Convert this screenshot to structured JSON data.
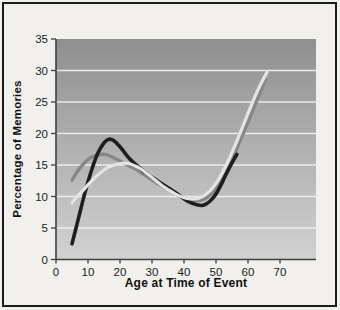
{
  "figure": {
    "background": "#f1f0ed",
    "border_color": "#1c1c1c"
  },
  "chart_data": {
    "type": "line",
    "xlabel": "Age at Time of Event",
    "ylabel": "Percentage of Memories",
    "xlim": [
      0,
      81
    ],
    "ylim": [
      0,
      35
    ],
    "x_ticks": [
      0,
      10,
      20,
      30,
      40,
      50,
      60,
      70
    ],
    "y_ticks": [
      0,
      5,
      10,
      15,
      20,
      25,
      30,
      35
    ],
    "grid": "horizontal-white-lines",
    "legend": "none",
    "plot_bg_gradient_top": "#8f8f8f",
    "plot_bg_gradient_bottom": "#d2d2d2",
    "gridline_color": "#f2f2f2",
    "axis_line_color": "#3f3f3f",
    "tick_label_color": "#1d1d1d",
    "series": [
      {
        "name": "gray-curve",
        "color": "#878787",
        "stroke_width": 3.4,
        "points": [
          [
            5,
            12.6
          ],
          [
            7,
            14.2
          ],
          [
            9,
            15.4
          ],
          [
            11,
            16.2
          ],
          [
            13,
            16.6
          ],
          [
            15,
            16.7
          ],
          [
            17,
            16.4
          ],
          [
            19,
            15.9
          ],
          [
            22,
            15.1
          ],
          [
            25,
            14.3
          ],
          [
            28,
            13.3
          ],
          [
            31,
            12.3
          ],
          [
            34,
            11.4
          ],
          [
            37,
            10.5
          ],
          [
            40,
            9.8
          ],
          [
            43,
            9.4
          ],
          [
            45,
            9.4
          ],
          [
            47,
            9.8
          ],
          [
            49,
            10.6
          ],
          [
            51,
            11.9
          ],
          [
            53,
            13.6
          ],
          [
            55,
            15.6
          ],
          [
            57,
            18.2
          ],
          [
            60,
            21.8
          ],
          [
            63,
            25.5
          ],
          [
            65.5,
            28.6
          ]
        ]
      },
      {
        "name": "black-curve",
        "color": "#1e1e1e",
        "stroke_width": 3.6,
        "points": [
          [
            5,
            2.5
          ],
          [
            7,
            6.5
          ],
          [
            9,
            10.5
          ],
          [
            11,
            14
          ],
          [
            13,
            16.8
          ],
          [
            15,
            18.5
          ],
          [
            16.5,
            19.1
          ],
          [
            18,
            18.9
          ],
          [
            20,
            17.9
          ],
          [
            23,
            16
          ],
          [
            26,
            14.6
          ],
          [
            29,
            13.4
          ],
          [
            32,
            12.4
          ],
          [
            35,
            11.4
          ],
          [
            38,
            10.4
          ],
          [
            41,
            9.3
          ],
          [
            44,
            8.7
          ],
          [
            46,
            8.6
          ],
          [
            48,
            9.2
          ],
          [
            50,
            10.4
          ],
          [
            52,
            12.3
          ],
          [
            54,
            14.4
          ],
          [
            56.5,
            16.7
          ]
        ]
      },
      {
        "name": "light-curve",
        "color": "#e4e4e4",
        "stroke_width": 3.2,
        "points": [
          [
            5,
            9
          ],
          [
            7,
            10.2
          ],
          [
            9,
            11.3
          ],
          [
            11,
            12.4
          ],
          [
            13,
            13.4
          ],
          [
            15,
            14.2
          ],
          [
            17,
            14.8
          ],
          [
            19,
            15.1
          ],
          [
            21,
            15.3
          ],
          [
            23,
            15.2
          ],
          [
            25,
            14.8
          ],
          [
            27,
            14.2
          ],
          [
            29,
            13.4
          ],
          [
            31,
            12.6
          ],
          [
            33,
            11.8
          ],
          [
            35,
            11.1
          ],
          [
            37,
            10.5
          ],
          [
            39,
            10
          ],
          [
            41,
            9.7
          ],
          [
            43,
            9.6
          ],
          [
            45,
            9.8
          ],
          [
            47,
            10.4
          ],
          [
            49,
            11.4
          ],
          [
            51,
            12.9
          ],
          [
            53,
            14.8
          ],
          [
            55,
            17
          ],
          [
            57,
            19.4
          ],
          [
            60,
            23.2
          ],
          [
            63,
            26.8
          ],
          [
            66,
            29.8
          ]
        ]
      }
    ]
  }
}
